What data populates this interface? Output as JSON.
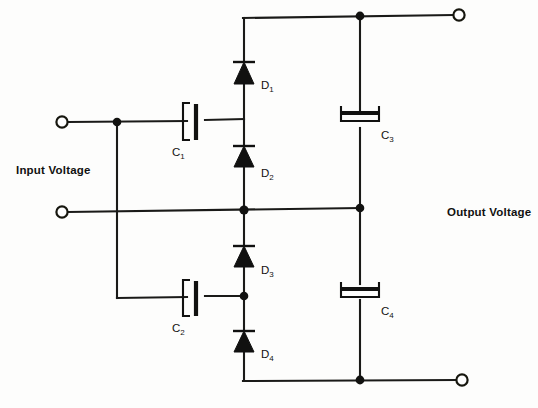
{
  "diagram": {
    "type": "circuit-schematic",
    "background_color": "#fdfdfc",
    "line_color": "#1a1a18"
  },
  "labels": {
    "input_voltage": "Input Voltage",
    "output_voltage": "Output Voltage"
  },
  "components": {
    "capacitors": [
      {
        "id": "C1",
        "name": "C",
        "subscript": "1",
        "orientation": "horizontal-series",
        "x": 195,
        "y": 122
      },
      {
        "id": "C2",
        "name": "C",
        "subscript": "2",
        "orientation": "horizontal-series",
        "x": 195,
        "y": 298
      },
      {
        "id": "C3",
        "name": "C",
        "subscript": "3",
        "orientation": "vertical-shunt",
        "x": 360,
        "y": 120
      },
      {
        "id": "C4",
        "name": "C",
        "subscript": "4",
        "orientation": "vertical-shunt",
        "x": 360,
        "y": 292
      }
    ],
    "diodes": [
      {
        "id": "D1",
        "name": "D",
        "subscript": "1",
        "direction": "up",
        "x": 244,
        "y": 72
      },
      {
        "id": "D2",
        "name": "D",
        "subscript": "2",
        "direction": "up",
        "x": 244,
        "y": 155
      },
      {
        "id": "D3",
        "name": "D",
        "subscript": "3",
        "direction": "up",
        "x": 244,
        "y": 255
      },
      {
        "id": "D4",
        "name": "D",
        "subscript": "4",
        "direction": "up",
        "x": 244,
        "y": 340
      }
    ],
    "terminals": [
      {
        "id": "in-top",
        "label": "input-terminal-top",
        "x": 60,
        "y": 122
      },
      {
        "id": "in-bottom",
        "label": "input-terminal-bottom",
        "x": 60,
        "y": 210
      },
      {
        "id": "out-top",
        "label": "output-terminal-top",
        "x": 461,
        "y": 16
      },
      {
        "id": "out-bottom",
        "label": "output-terminal-bottom",
        "x": 464,
        "y": 380
      }
    ],
    "junctions": [
      {
        "id": "j-in-top",
        "x": 117,
        "y": 122
      },
      {
        "id": "j-center",
        "x": 244,
        "y": 210
      },
      {
        "id": "j-c2-right",
        "x": 244,
        "y": 296
      },
      {
        "id": "j-top-rail",
        "x": 360,
        "y": 16
      },
      {
        "id": "j-mid-right",
        "x": 360,
        "y": 208
      },
      {
        "id": "j-bottom-rail",
        "x": 360,
        "y": 380
      }
    ]
  }
}
